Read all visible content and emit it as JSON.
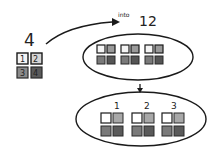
{
  "diagram": {
    "source_label": "4",
    "arrow_label_small": "into",
    "arrow_label_big": "12",
    "source_tiles": [
      {
        "label": "1",
        "shade": "light"
      },
      {
        "label": "2",
        "shade": "light"
      },
      {
        "label": "3",
        "shade": "mid"
      },
      {
        "label": "4",
        "shade": "dark"
      }
    ],
    "group_labels": [
      "1",
      "2",
      "3"
    ],
    "colors": {
      "stroke": "#1a1a1a",
      "tile_white": "#f4f4f4",
      "tile_light": "#bdbdbd",
      "tile_mid": "#8a8a8a",
      "tile_dark": "#5a5a5a"
    }
  }
}
